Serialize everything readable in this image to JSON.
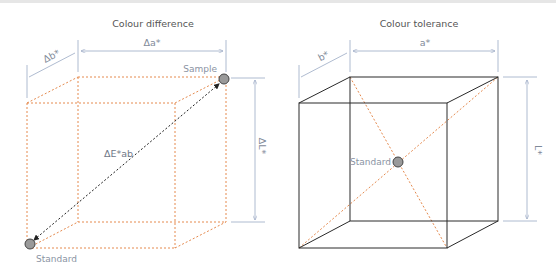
{
  "colors": {
    "dotted_edge": "#e58a4e",
    "solid_edge": "#2a2a2a",
    "dimension_line": "#9aa9c4",
    "point_fill": "#9a9a9a",
    "point_stroke": "#444444",
    "text": "#555555",
    "label_text": "#8a93a3"
  },
  "diagrams": [
    {
      "title": "Colour difference",
      "dimensions": {
        "a": "Δa*",
        "b": "Δb*",
        "L": "ΔL*"
      },
      "vector_label": "ΔE*ab",
      "points": [
        {
          "label": "Sample"
        },
        {
          "label": "Standard"
        }
      ]
    },
    {
      "title": "Colour tolerance",
      "dimensions": {
        "a": "a*",
        "b": "b*",
        "L": "L*"
      },
      "points": [
        {
          "label": "Standard"
        }
      ]
    }
  ]
}
